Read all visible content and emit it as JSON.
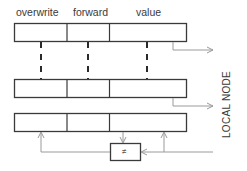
{
  "diagram": {
    "field_labels": [
      "overwrite",
      "forward",
      "value"
    ],
    "side_label": "LOCAL NODE",
    "comparator_symbol": "≠",
    "rows": 3,
    "colors": {
      "box_stroke": "#3a3a3a",
      "arrow_stroke": "#9a9a9a",
      "dash_stroke": "#2a2a2a",
      "text": "#3a3a3a"
    }
  }
}
